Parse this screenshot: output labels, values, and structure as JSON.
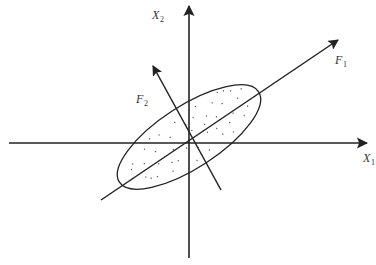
{
  "diagram": {
    "title": "",
    "colors": {
      "stroke": "#222222",
      "text": "#333333",
      "dots": "#555555",
      "background": "#ffffff"
    },
    "origin": {
      "x": 189,
      "y": 143
    },
    "axes": [
      {
        "id": "X1",
        "label": "X",
        "subscript": "1",
        "direction": "horizontal"
      },
      {
        "id": "X2",
        "label": "X",
        "subscript": "2",
        "direction": "vertical"
      },
      {
        "id": "F1",
        "label": "F",
        "subscript": "1",
        "direction": "principal-major"
      },
      {
        "id": "F2",
        "label": "F",
        "subscript": "2",
        "direction": "principal-minor"
      }
    ],
    "ellipse": {
      "description": "Point cloud enclosed by an ellipse aligned with F1",
      "rotation_deg": -33,
      "semi_major": 83,
      "semi_minor": 31
    }
  }
}
